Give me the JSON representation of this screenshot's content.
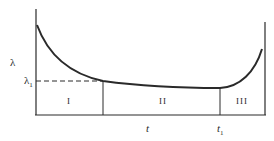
{
  "diagram": {
    "type": "bathtub-curve",
    "y_axis_label": "λ",
    "y_marker_label": "λ",
    "y_marker_subscript": "1",
    "x_axis_label": "t",
    "x_marker_label": "t",
    "x_marker_subscript": "1",
    "regions": [
      {
        "label": "I"
      },
      {
        "label": "II"
      },
      {
        "label": "III"
      }
    ],
    "colors": {
      "line": "#2a2a2a",
      "background": "#ffffff"
    }
  }
}
